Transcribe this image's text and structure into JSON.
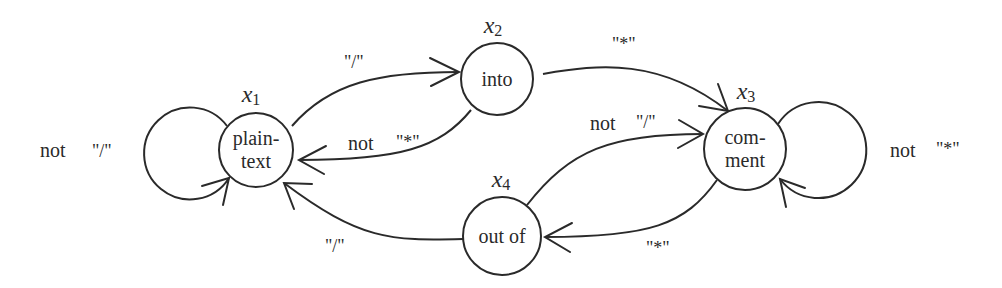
{
  "diagram": {
    "type": "state-machine",
    "states": [
      {
        "id": "x1",
        "var": "x",
        "sub": "1",
        "line1": "plain-",
        "line2": "text"
      },
      {
        "id": "x2",
        "var": "x",
        "sub": "2",
        "line1": "into",
        "line2": ""
      },
      {
        "id": "x3",
        "var": "x",
        "sub": "3",
        "line1": "com-",
        "line2": "ment"
      },
      {
        "id": "x4",
        "var": "x",
        "sub": "4",
        "line1": "out of",
        "line2": ""
      }
    ],
    "transitions": [
      {
        "from": "x1",
        "to": "x1",
        "prefix": "not",
        "symbol": "\"/\""
      },
      {
        "from": "x1",
        "to": "x2",
        "prefix": "",
        "symbol": "\"/\""
      },
      {
        "from": "x2",
        "to": "x1",
        "prefix": "not",
        "symbol": "\"*\""
      },
      {
        "from": "x2",
        "to": "x3",
        "prefix": "",
        "symbol": "\"*\""
      },
      {
        "from": "x4",
        "to": "x3",
        "prefix": "not",
        "symbol": "\"/\""
      },
      {
        "from": "x3",
        "to": "x3",
        "prefix": "not",
        "symbol": "\"*\""
      },
      {
        "from": "x3",
        "to": "x4",
        "prefix": "",
        "symbol": "\"*\""
      },
      {
        "from": "x4",
        "to": "x1",
        "prefix": "",
        "symbol": "\"/\""
      }
    ]
  }
}
